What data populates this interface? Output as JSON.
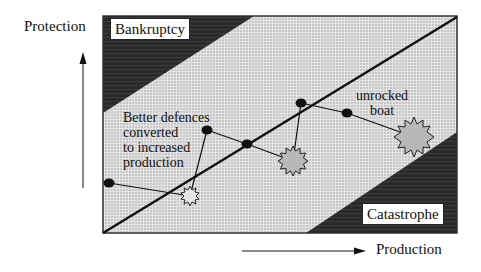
{
  "axes": {
    "y_label": "Protection",
    "x_label": "Production"
  },
  "regions": {
    "top_left": "Bankruptcy",
    "bottom_right": "Catastrophe",
    "middle_fill": "dotted light gray",
    "corner_fill": "#2a2a2a"
  },
  "annotations": {
    "defences": [
      "Better defences",
      "converted",
      "to increased",
      "production"
    ],
    "boat": [
      "unrocked",
      "boat"
    ]
  },
  "path_nodes": [
    {
      "type": "dot",
      "x": 109,
      "y": 183
    },
    {
      "type": "starburst",
      "size": "small",
      "x": 190,
      "y": 196
    },
    {
      "type": "dot",
      "x": 207,
      "y": 130
    },
    {
      "type": "dot",
      "x": 247,
      "y": 144
    },
    {
      "type": "starburst",
      "size": "medium",
      "x": 293,
      "y": 161
    },
    {
      "type": "dot",
      "x": 301,
      "y": 103
    },
    {
      "type": "dot",
      "x": 347,
      "y": 113
    },
    {
      "type": "starburst",
      "size": "large",
      "x": 414,
      "y": 137
    }
  ],
  "colors": {
    "dark": "#2a2a2a",
    "dots": "#111111",
    "starburst_fill": "#b8b8b8",
    "starburst_small_fill": "#e6e6e6"
  }
}
